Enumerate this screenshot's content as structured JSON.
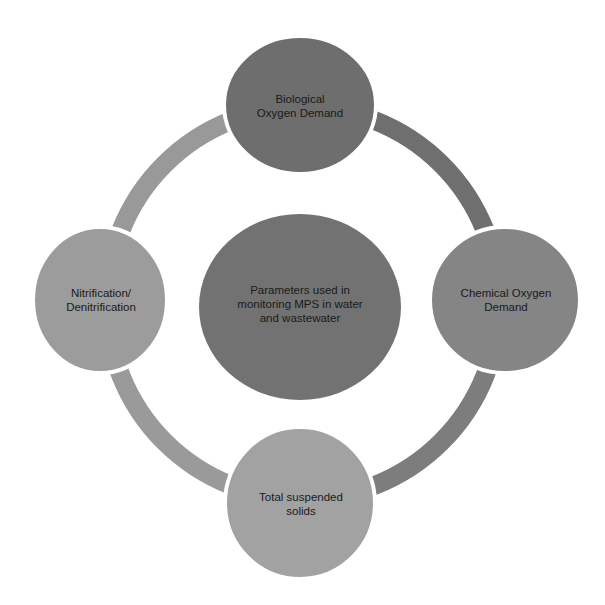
{
  "diagram": {
    "type": "radial-cycle",
    "center": {
      "label": "Parameters used in\nmonitoring MPS in water\nand wastewater",
      "color": "#727272"
    },
    "nodes": [
      {
        "id": "top",
        "label": "Biological\nOxygen Demand",
        "color": "#6e6e6e"
      },
      {
        "id": "right",
        "label": "Chemical Oxygen\nDemand",
        "color": "#858585"
      },
      {
        "id": "bottom",
        "label": "Total suspended\nsolids",
        "color": "#a2a2a2"
      },
      {
        "id": "left",
        "label": "Nitrification/\nDenitrification",
        "color": "#9c9c9c"
      }
    ],
    "ring": {
      "arc_top_right_color": "#6f6f6f",
      "arc_bottom_right_color": "#7d7d7d",
      "arc_bottom_left_color": "#9a9a9a",
      "arc_top_left_color": "#999999"
    }
  }
}
